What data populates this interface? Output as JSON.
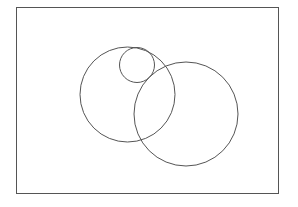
{
  "diagram": {
    "type": "circles-in-rectangle",
    "stroke_color": "#555555",
    "background": "#ffffff",
    "frame": {
      "x": 16.5,
      "y": 7.5,
      "width": 262,
      "height": 186
    },
    "circles": [
      {
        "name": "large-left-circle",
        "cx": 127.5,
        "cy": 94.5,
        "r": 47.5
      },
      {
        "name": "small-top-circle",
        "cx": 137,
        "cy": 65,
        "r": 17.5
      },
      {
        "name": "large-right-circle",
        "cx": 186,
        "cy": 114,
        "r": 52
      }
    ]
  }
}
